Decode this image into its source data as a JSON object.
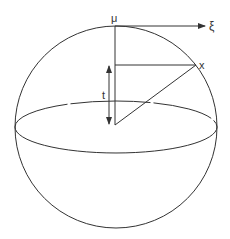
{
  "diagram": {
    "type": "sphere-geometry",
    "labels": {
      "mu": "μ",
      "xi": "ξ",
      "x": "x",
      "t": "t"
    },
    "colors": {
      "stroke": "#333333",
      "background": "#ffffff"
    }
  }
}
